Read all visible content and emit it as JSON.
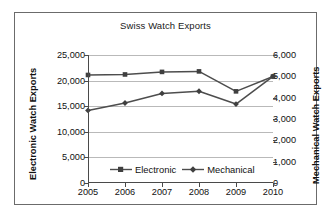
{
  "chart_data": {
    "type": "line",
    "title": "Swiss Watch Exports",
    "xlabel": "",
    "categories": [
      "2005",
      "2006",
      "2007",
      "2008",
      "2009",
      "2010"
    ],
    "grid": true,
    "legend_position": "inside-bottom-center",
    "axes": {
      "left": {
        "label": "Electronic Watch Exports",
        "ylim": [
          0,
          25000
        ],
        "ticks": [
          "0",
          "5,000",
          "10,000",
          "15,000",
          "20,000",
          "25,000"
        ],
        "tick_values": [
          0,
          5000,
          10000,
          15000,
          20000,
          25000
        ]
      },
      "right": {
        "label": "Mechanical Watch Exports",
        "ylim": [
          0,
          6000
        ],
        "ticks": [
          "0",
          "1,000",
          "2,000",
          "3,000",
          "4,000",
          "5,000",
          "6,000"
        ],
        "tick_values": [
          0,
          1000,
          2000,
          3000,
          4000,
          5000,
          6000
        ]
      }
    },
    "series": [
      {
        "name": "Electronic",
        "axis": "left",
        "marker": "square",
        "color": "#4d4d4d",
        "values": [
          21100,
          21200,
          21700,
          21800,
          17900,
          20800
        ]
      },
      {
        "name": "Mechanical",
        "axis": "right",
        "marker": "diamond",
        "color": "#4d4d4d",
        "values": [
          3400,
          3750,
          4200,
          4300,
          3700,
          5000
        ]
      }
    ]
  },
  "legend": {
    "items": [
      {
        "label": "Electronic"
      },
      {
        "label": "Mechanical"
      }
    ]
  }
}
